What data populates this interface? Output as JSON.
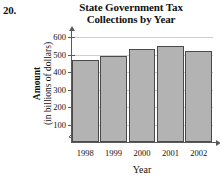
{
  "problem": {
    "number": "20."
  },
  "chart_data": {
    "type": "bar",
    "title": "State Government Tax Collections by Year",
    "title_lines": [
      "State Government Tax",
      "Collections by Year"
    ],
    "xlabel": "Year",
    "ylabel": "Amount",
    "ylabel_sub": "(in billions of dollars)",
    "categories": [
      "1998",
      "1999",
      "2000",
      "2001",
      "2002"
    ],
    "values": [
      470,
      495,
      535,
      552,
      522
    ],
    "ylim": [
      0,
      620
    ],
    "yticks": [
      100,
      200,
      300,
      400,
      500,
      600
    ],
    "ytick_labels": [
      "100",
      "200",
      "300",
      "400",
      "500",
      "600"
    ],
    "grid": true,
    "legend": "none",
    "axis_break": true,
    "bar_fill": "#b3b3b3",
    "bar_edge": "#4a4a4a",
    "grid_color": "#cfcfcf",
    "axis_color": "#5a5a5a"
  }
}
